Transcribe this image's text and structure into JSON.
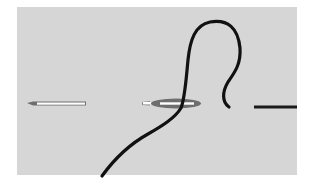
{
  "figure": {
    "colors": {
      "background": "#ffffff",
      "panel": "#d6d6d6",
      "thread": "#111111",
      "needle_body": "#6e6e6e",
      "needle_eye": "#ffffff"
    },
    "elements": [
      {
        "name": "needle-left",
        "label": "Needle"
      },
      {
        "name": "needle-threaded",
        "label": "Threaded needle"
      },
      {
        "name": "thread-loop",
        "label": "Thread"
      },
      {
        "name": "thread-end",
        "label": "Thread end"
      }
    ]
  }
}
